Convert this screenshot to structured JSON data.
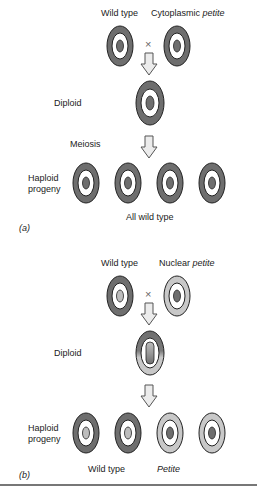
{
  "panel_a": {
    "parents": {
      "left_label": "Wild type",
      "right_label_prefix": "Cytoplasmic ",
      "right_label_italic": "petite"
    },
    "cross_symbol": "×",
    "diploid_label": "Diploid",
    "meiosis_label": "Meiosis",
    "progeny_label_line1": "Haploid",
    "progeny_label_line2": "progeny",
    "result_label": "All wild type",
    "panel_tag": "(a)"
  },
  "panel_b": {
    "parents": {
      "left_label": "Wild type",
      "right_label_prefix": "Nuclear ",
      "right_label_italic": "petite"
    },
    "cross_symbol": "×",
    "diploid_label": "Diploid",
    "progeny_label_line1": "Haploid",
    "progeny_label_line2": "progeny",
    "result_left": "Wild type",
    "result_right": "Petite",
    "panel_tag": "(b)"
  },
  "colors": {
    "dark_ring": "#6e6e6e",
    "light_ring": "#c8c8c8",
    "nucleus_dark": "#6e6e6e",
    "nucleus_light": "#bdbdbd",
    "arrow_fill": "#ececec",
    "outline": "#222222"
  }
}
